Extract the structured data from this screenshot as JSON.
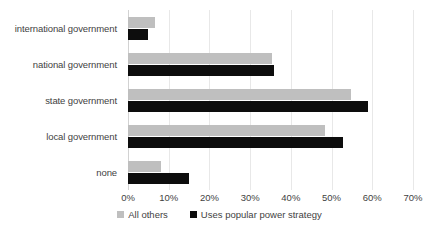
{
  "chart_data": {
    "type": "bar",
    "orientation": "horizontal",
    "title": "",
    "xlabel": "",
    "ylabel": "",
    "categories": [
      "international government",
      "national government",
      "state government",
      "local government",
      "none"
    ],
    "series": [
      {
        "name": "All others",
        "color": "#bfbfbf",
        "values": [
          6.6,
          35.4,
          54.8,
          48.4,
          8.0
        ]
      },
      {
        "name": "Uses popular power strategy",
        "color": "#0d0d0d",
        "values": [
          5.0,
          35.9,
          59.0,
          52.8,
          15.0
        ]
      }
    ],
    "xlim": [
      0,
      70
    ],
    "xticks": [
      0,
      10,
      20,
      30,
      40,
      50,
      60,
      70
    ],
    "xtick_labels": [
      "0%",
      "10%",
      "20%",
      "30%",
      "40%",
      "50%",
      "60%",
      "70%"
    ],
    "grid": true,
    "grid_axis": "x",
    "legend_position": "bottom",
    "value_suffix": "%"
  }
}
